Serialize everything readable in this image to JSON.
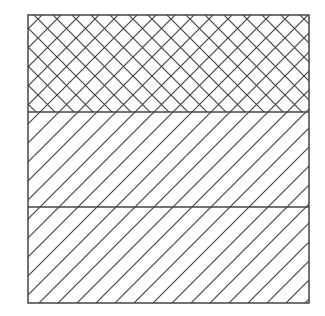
{
  "diagram": {
    "type": "stacked-hatched-regions",
    "frame": {
      "x": 28,
      "y": 15,
      "width": 281,
      "height": 288,
      "stroke": "#444444"
    },
    "regions": [
      {
        "name": "top-region",
        "pattern": "crosshatch",
        "y": 15,
        "height": 97
      },
      {
        "name": "middle-region",
        "pattern": "diagonal",
        "y": 112,
        "height": 95
      },
      {
        "name": "bottom-region",
        "pattern": "diagonal",
        "y": 207,
        "height": 96
      }
    ],
    "hatch_spacing": 19,
    "line_color": "#444444",
    "background": "#ffffff"
  }
}
